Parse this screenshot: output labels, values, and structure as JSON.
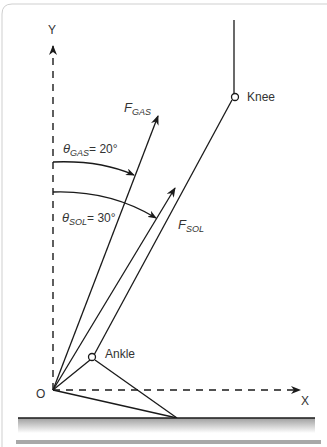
{
  "axes": {
    "y_label": "Y",
    "x_label": "X",
    "origin_label": "O"
  },
  "joints": {
    "knee_label": "Knee",
    "ankle_label": "Ankle"
  },
  "forces": {
    "gas": {
      "symbol": "F",
      "subscript": "GAS"
    },
    "sol": {
      "symbol": "F",
      "subscript": "SOL"
    }
  },
  "angles": {
    "gas": {
      "symbol": "θ",
      "subscript": "GAS",
      "value": "= 20°"
    },
    "sol": {
      "symbol": "θ",
      "subscript": "SOL",
      "value": "= 30°"
    }
  },
  "colors": {
    "line": "#1a1a1a",
    "text": "#333333",
    "ground_gradient_top": "#b0b0b0",
    "ground_gradient_bottom": "#ffffff",
    "bottom_bar": "#a8a8a8",
    "border": "#c8c8c8"
  }
}
